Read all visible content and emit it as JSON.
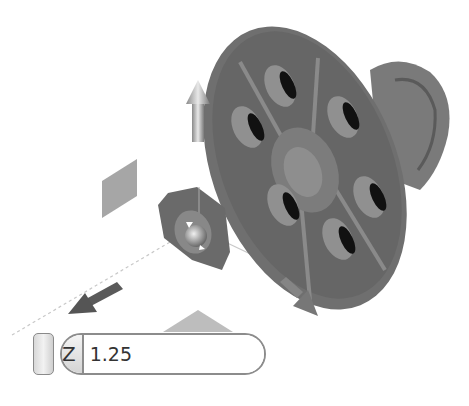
{
  "scene": {
    "model": "flange-with-hex-nut",
    "colors": {
      "part": "#6b6b6b",
      "part_light": "#8c8c8c",
      "hole": "#111111",
      "background": "#ffffff",
      "manipulator": "#9a9a9a",
      "plane_handle": "#a8a8a8"
    }
  },
  "manipulator": {
    "handles": [
      "up-arrow",
      "left-arrow",
      "right-arrow",
      "plane-handle",
      "rotate-handle"
    ]
  },
  "value_box": {
    "axis_label": "Z",
    "value": "1.25"
  }
}
